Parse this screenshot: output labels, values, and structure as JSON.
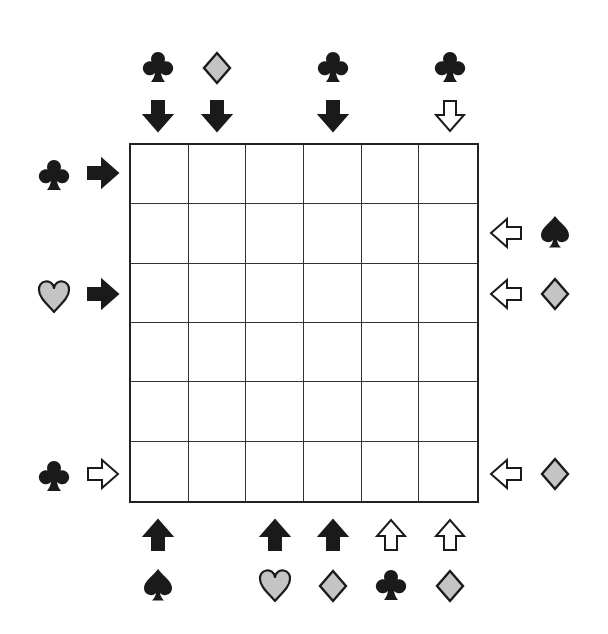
{
  "puzzle": {
    "grid": {
      "rows": 6,
      "cols": 6,
      "cells": [
        [
          "",
          "",
          "",
          "",
          "",
          ""
        ],
        [
          "",
          "",
          "",
          "",
          "",
          ""
        ],
        [
          "",
          "",
          "",
          "",
          "",
          ""
        ],
        [
          "",
          "",
          "",
          "",
          "",
          ""
        ],
        [
          "",
          "",
          "",
          "",
          "",
          ""
        ],
        [
          "",
          "",
          "",
          "",
          "",
          ""
        ]
      ]
    },
    "colors": {
      "black": "#1a1a1a",
      "gray": "#c4c4c4",
      "outline": "#1a1a1a",
      "white": "#ffffff"
    },
    "clues": {
      "top": [
        {
          "col": 1,
          "suit": "club",
          "arrow": "down",
          "arrow_fill": "black"
        },
        {
          "col": 2,
          "suit": "diamond",
          "arrow": "down",
          "arrow_fill": "black"
        },
        {
          "col": 4,
          "suit": "club",
          "arrow": "down",
          "arrow_fill": "black"
        },
        {
          "col": 6,
          "suit": "club",
          "arrow": "down",
          "arrow_fill": "white"
        }
      ],
      "bottom": [
        {
          "col": 1,
          "suit": "spade",
          "arrow": "up",
          "arrow_fill": "black"
        },
        {
          "col": 3,
          "suit": "heart",
          "arrow": "up",
          "arrow_fill": "black"
        },
        {
          "col": 4,
          "suit": "diamond",
          "arrow": "up",
          "arrow_fill": "black"
        },
        {
          "col": 5,
          "suit": "club",
          "arrow": "up",
          "arrow_fill": "white"
        },
        {
          "col": 6,
          "suit": "diamond",
          "arrow": "up",
          "arrow_fill": "white"
        }
      ],
      "left": [
        {
          "row": 1,
          "suit": "club",
          "arrow": "right",
          "arrow_fill": "black"
        },
        {
          "row": 3,
          "suit": "heart",
          "arrow": "right",
          "arrow_fill": "black"
        },
        {
          "row": 6,
          "suit": "club",
          "arrow": "right",
          "arrow_fill": "white"
        }
      ],
      "right": [
        {
          "row": 2,
          "suit": "spade",
          "arrow": "left",
          "arrow_fill": "white"
        },
        {
          "row": 3,
          "suit": "diamond",
          "arrow": "left",
          "arrow_fill": "white"
        },
        {
          "row": 6,
          "suit": "diamond",
          "arrow": "left",
          "arrow_fill": "white"
        }
      ]
    }
  }
}
